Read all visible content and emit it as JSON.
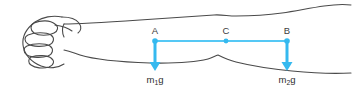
{
  "figure": {
    "background_color": "#ffffff",
    "outline_color": "#4a4a4a",
    "accent_color": "#35b9ef",
    "line_color": "#55c8f5"
  },
  "anatomy": {
    "fist_label": "closed-fist",
    "forearm_label": "forearm-outline"
  },
  "points": [
    {
      "id": "A",
      "label": "A",
      "x": 155,
      "y": 41
    },
    {
      "id": "C",
      "label": "C",
      "x": 226,
      "y": 41
    },
    {
      "id": "B",
      "label": "B",
      "x": 287,
      "y": 41
    }
  ],
  "forces": [
    {
      "id": "F1",
      "origin": "A",
      "label_text": "m",
      "label_sub": "1",
      "label_tail": "g",
      "label_full": "m₁g",
      "x": 155,
      "y_start": 41,
      "y_end": 70,
      "direction": "down"
    },
    {
      "id": "F2",
      "origin": "B",
      "label_text": "m",
      "label_sub": "2",
      "label_tail": "g",
      "label_full": "m₂g",
      "x": 287,
      "y_start": 41,
      "y_end": 70,
      "direction": "down"
    }
  ],
  "connector": {
    "name": "horizontal-force-line",
    "x_start": 155,
    "x_end": 287,
    "y": 41
  }
}
